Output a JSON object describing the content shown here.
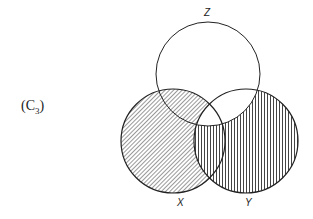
{
  "diagram": {
    "type": "venn",
    "panel_label": "(C",
    "panel_subscript": "3",
    "panel_close": ")",
    "sets": [
      {
        "name": "Z",
        "label": "Z",
        "cx": 208,
        "cy": 74,
        "r": 52
      },
      {
        "name": "X",
        "label": "X",
        "cx": 173,
        "cy": 141,
        "r": 52
      },
      {
        "name": "Y",
        "label": "Y",
        "cx": 246,
        "cy": 141,
        "r": 52
      }
    ],
    "shading": {
      "X_minus_Y": "diagonal-hatch",
      "Y_minus_Z": "vertical-hatch",
      "X_and_Y_and_Z": "none",
      "Y_and_Z_minus_X": "none",
      "Z_only": "none"
    },
    "colors": {
      "stroke": "#222222",
      "hatch": "#333333",
      "background": "#ffffff"
    }
  }
}
